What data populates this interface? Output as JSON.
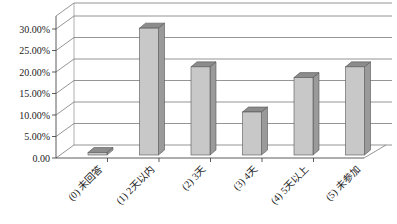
{
  "chart_data": {
    "type": "bar",
    "style": "3d-column",
    "title": "",
    "xlabel": "",
    "ylabel": "",
    "categories": [
      "(0) 未回答",
      "(1) 2天以内",
      "(2) 3天",
      "(3) 4天",
      "(4) 5天以上",
      "(5) 未参加"
    ],
    "values": [
      0.5,
      29.5,
      20.5,
      10.0,
      18.0,
      20.5
    ],
    "unit": "%",
    "ylim": [
      0,
      30
    ],
    "yticks": [
      "0.00",
      "5.00%",
      "10.00%",
      "15.00%",
      "20.00%",
      "25.00%",
      "30.00%"
    ],
    "grid": true,
    "legend": "none",
    "colors": {
      "bar_front": "#c8c8c8",
      "bar_side": "#9a9a9a",
      "bar_top": "#8c8c8c",
      "grid": "#7a7a7a"
    }
  }
}
